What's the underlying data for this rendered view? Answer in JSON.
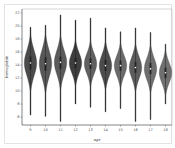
{
  "chart_data": {
    "type": "violin",
    "title": "",
    "xlabel": "age",
    "ylabel": "hemoglobin",
    "categories": [
      "9",
      "10",
      "11",
      "12",
      "13",
      "14",
      "15",
      "16",
      "17",
      "18"
    ],
    "ylim": [
      5,
      22.5
    ],
    "yticks": [
      6,
      8,
      10,
      12,
      14,
      16,
      18,
      20,
      22
    ],
    "grid": false,
    "series": [
      {
        "name": "hemoglobin",
        "min": [
          6.3,
          6.1,
          5.3,
          8.0,
          7.5,
          6.8,
          7.3,
          5.3,
          5.6,
          8.0
        ],
        "q1": [
          13.3,
          13.1,
          13.4,
          13.5,
          13.4,
          13.1,
          13.1,
          12.8,
          12.6,
          12.0
        ],
        "median": [
          14.3,
          14.2,
          14.4,
          14.3,
          14.2,
          13.9,
          13.9,
          13.6,
          13.4,
          12.8
        ],
        "q3": [
          15.3,
          15.2,
          15.3,
          15.1,
          15.0,
          14.8,
          14.7,
          14.5,
          14.3,
          13.6
        ],
        "max": [
          19.8,
          20.1,
          21.7,
          20.9,
          21.2,
          19.7,
          19.1,
          19.7,
          19.0,
          17.2
        ]
      }
    ],
    "colors": [
      "#4a4a4a",
      "#585858",
      "#5a5a5a",
      "#3e3e3e",
      "#606060",
      "#4c4c4c",
      "#6a6a6a",
      "#5c5c5c",
      "#6e6e6e",
      "#707070"
    ]
  }
}
